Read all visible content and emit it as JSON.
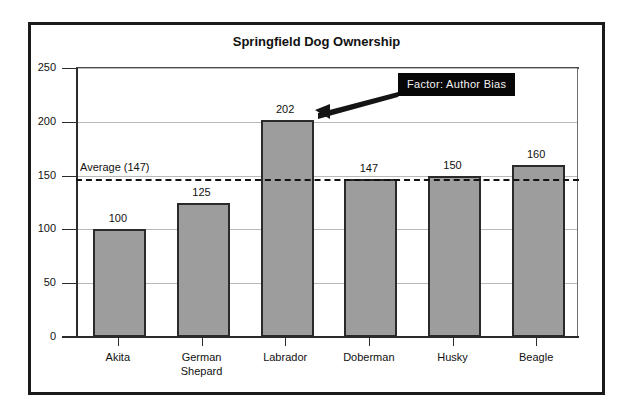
{
  "chart_data": {
    "type": "bar",
    "title": "Springfield Dog Ownership",
    "xlabel": "",
    "ylabel": "",
    "ylim": [
      0,
      250
    ],
    "grid": true,
    "legend": "none",
    "categories": [
      "Akita",
      "German Shepard",
      "Labrador",
      "Doberman",
      "Husky",
      "Beagle"
    ],
    "category_lines": [
      [
        "Akita"
      ],
      [
        "German",
        "Shepard"
      ],
      [
        "Labrador"
      ],
      [
        "Doberman"
      ],
      [
        "Husky"
      ],
      [
        "Beagle"
      ]
    ],
    "values": [
      100,
      125,
      202,
      147,
      150,
      160
    ],
    "value_labels": [
      "100",
      "125",
      "202",
      "147",
      "150",
      "160"
    ],
    "yticks": [
      0,
      50,
      100,
      150,
      200,
      250
    ],
    "ytick_labels": [
      "0",
      "50",
      "100",
      "150",
      "200",
      "250"
    ],
    "reference_line": {
      "value": 147,
      "label": "Average (147)",
      "style": "dashed"
    },
    "annotations": [
      {
        "text": "Factor: Author Bias",
        "points_to_category": "Labrador",
        "points_to_value": 202
      }
    ],
    "colors": {
      "bar_fill": "#9d9d9d",
      "bar_border": "#2a2a2a",
      "gridline": "#b9b9b9",
      "axis": "#2b2b2b",
      "callout_background": "#070707",
      "callout_text": "#f2f2f2",
      "frame": "#1a1a1a",
      "plot_background": "#ffffff",
      "text": "#111111"
    }
  }
}
